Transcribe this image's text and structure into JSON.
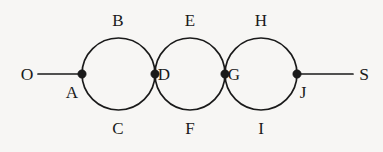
{
  "diagram": {
    "type": "graph-diagram",
    "background_color": "#f7f6f4",
    "ink_color": "#1a1a1a",
    "canvas": {
      "width": 383,
      "height": 152
    },
    "geometry": {
      "circle_radius": 36,
      "node_radius": 4.2,
      "baseline_y": 74,
      "circle_centers_x": [
        118,
        190,
        261
      ]
    },
    "terminals": [
      {
        "id": "O",
        "label": "O",
        "x": 27,
        "y": 75,
        "side": "left"
      },
      {
        "id": "S",
        "label": "S",
        "x": 364,
        "y": 75,
        "side": "right"
      }
    ],
    "vertices": [
      {
        "id": "A",
        "label": "A",
        "x": 82,
        "y": 74,
        "label_x": 72,
        "label_y": 92
      },
      {
        "id": "D",
        "label": "D",
        "x": 155,
        "y": 74,
        "label_x": 164,
        "label_y": 74
      },
      {
        "id": "G",
        "label": "G",
        "x": 225,
        "y": 74,
        "label_x": 234,
        "label_y": 74
      },
      {
        "id": "J",
        "label": "J",
        "x": 297,
        "y": 74,
        "label_x": 303,
        "label_y": 92
      }
    ],
    "edges": [
      {
        "id": "OA",
        "label": "",
        "from": "O",
        "to": "A",
        "shape": "straight"
      },
      {
        "id": "B",
        "label": "B",
        "from": "A",
        "to": "D",
        "shape": "arc-upper",
        "label_x": 118,
        "label_y": 20
      },
      {
        "id": "C",
        "label": "C",
        "from": "A",
        "to": "D",
        "shape": "arc-lower",
        "label_x": 118,
        "label_y": 128
      },
      {
        "id": "E",
        "label": "E",
        "from": "D",
        "to": "G",
        "shape": "arc-upper",
        "label_x": 190,
        "label_y": 20
      },
      {
        "id": "F",
        "label": "F",
        "from": "D",
        "to": "G",
        "shape": "arc-lower",
        "label_x": 190,
        "label_y": 128
      },
      {
        "id": "H",
        "label": "H",
        "from": "G",
        "to": "J",
        "shape": "arc-upper",
        "label_x": 261,
        "label_y": 20
      },
      {
        "id": "I",
        "label": "I",
        "from": "G",
        "to": "J",
        "shape": "arc-lower",
        "label_x": 261,
        "label_y": 128
      },
      {
        "id": "JS",
        "label": "",
        "from": "J",
        "to": "S",
        "shape": "straight"
      }
    ]
  }
}
